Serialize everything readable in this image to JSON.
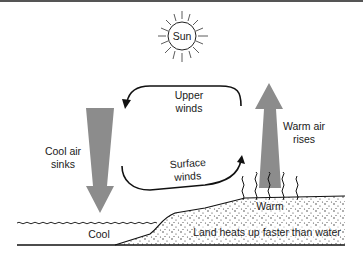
{
  "diagram": {
    "sun": {
      "label": "Sun"
    },
    "arrows": {
      "upper_winds": {
        "line1": "Upper",
        "line2": "winds"
      },
      "surface_winds": {
        "line1": "Surface",
        "line2": "winds"
      },
      "cool_air": {
        "line1": "Cool air",
        "line2": "sinks"
      },
      "warm_air": {
        "line1": "Warm air",
        "line2": "rises"
      }
    },
    "labels": {
      "water": "Cool",
      "land_top": "Warm",
      "land_caption": "Land heats up faster than water"
    },
    "colors": {
      "arrow_fill": "#8c8c8c",
      "line": "#111111",
      "background": "#ffffff"
    }
  }
}
